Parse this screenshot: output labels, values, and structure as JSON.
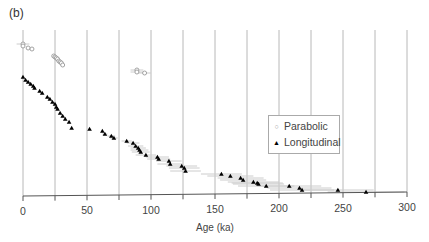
{
  "panel_label": "(b)",
  "chart_data": {
    "type": "scatter",
    "title": "",
    "panel": "(b)",
    "xlabel": "Age (ka)",
    "ylabel": "",
    "xlim": [
      0,
      300
    ],
    "xticks": [
      0,
      50,
      100,
      150,
      200,
      250,
      300
    ],
    "minor_gridlines_every": 25,
    "grid": "vertical",
    "legend_position": "right-middle",
    "series": [
      {
        "name": "Parabolic",
        "marker": "open-circle",
        "color": "#999999",
        "points": [
          {
            "x": 0,
            "y": 44,
            "err": 5
          },
          {
            "x": 0,
            "y": 46,
            "err": 0
          },
          {
            "x": 4,
            "y": 48,
            "err": 0
          },
          {
            "x": 7,
            "y": 49,
            "err": 0
          },
          {
            "x": 24,
            "y": 56,
            "err": 0
          },
          {
            "x": 25,
            "y": 57,
            "err": 0
          },
          {
            "x": 26,
            "y": 58,
            "err": 0
          },
          {
            "x": 27,
            "y": 59,
            "err": 0
          },
          {
            "x": 28,
            "y": 61,
            "err": 0
          },
          {
            "x": 29,
            "y": 62,
            "err": 0
          },
          {
            "x": 30,
            "y": 63,
            "err": 0
          },
          {
            "x": 31,
            "y": 65,
            "err": 0
          },
          {
            "x": 89,
            "y": 70,
            "err": 5
          },
          {
            "x": 89,
            "y": 72,
            "err": 5
          },
          {
            "x": 95,
            "y": 73,
            "err": 5
          }
        ]
      },
      {
        "name": "Longitudinal",
        "marker": "filled-triangle",
        "color": "#000000",
        "points": [
          {
            "x": 0,
            "y": 77,
            "err": 0
          },
          {
            "x": 2,
            "y": 80,
            "err": 0
          },
          {
            "x": 4,
            "y": 82,
            "err": 0
          },
          {
            "x": 6,
            "y": 84,
            "err": 0
          },
          {
            "x": 8,
            "y": 86,
            "err": 0
          },
          {
            "x": 9,
            "y": 88,
            "err": 0
          },
          {
            "x": 13,
            "y": 91,
            "err": 0
          },
          {
            "x": 15,
            "y": 93,
            "err": 0
          },
          {
            "x": 19,
            "y": 97,
            "err": 0
          },
          {
            "x": 21,
            "y": 99,
            "err": 0
          },
          {
            "x": 23,
            "y": 102,
            "err": 0
          },
          {
            "x": 25,
            "y": 104,
            "err": 0
          },
          {
            "x": 26,
            "y": 107,
            "err": 0
          },
          {
            "x": 27,
            "y": 109,
            "err": 0
          },
          {
            "x": 29,
            "y": 113,
            "err": 0
          },
          {
            "x": 31,
            "y": 116,
            "err": 0
          },
          {
            "x": 33,
            "y": 119,
            "err": 0
          },
          {
            "x": 36,
            "y": 122,
            "err": 0
          },
          {
            "x": 38,
            "y": 128,
            "err": 0
          },
          {
            "x": 52,
            "y": 129,
            "err": 0
          },
          {
            "x": 62,
            "y": 131,
            "err": 0
          },
          {
            "x": 64,
            "y": 134,
            "err": 2
          },
          {
            "x": 69,
            "y": 136,
            "err": 3
          },
          {
            "x": 71,
            "y": 138,
            "err": 3
          },
          {
            "x": 81,
            "y": 141,
            "err": 4
          },
          {
            "x": 86,
            "y": 143,
            "err": 5
          },
          {
            "x": 88,
            "y": 146,
            "err": 6
          },
          {
            "x": 90,
            "y": 148,
            "err": 6
          },
          {
            "x": 91,
            "y": 150,
            "err": 7
          },
          {
            "x": 92,
            "y": 152,
            "err": 7
          },
          {
            "x": 96,
            "y": 155,
            "err": 8
          },
          {
            "x": 105,
            "y": 157,
            "err": 9
          },
          {
            "x": 106,
            "y": 159,
            "err": 9
          },
          {
            "x": 114,
            "y": 161,
            "err": 10
          },
          {
            "x": 115,
            "y": 164,
            "err": 10
          },
          {
            "x": 124,
            "y": 166,
            "err": 12
          },
          {
            "x": 126,
            "y": 168,
            "err": 12
          },
          {
            "x": 127,
            "y": 171,
            "err": 12
          },
          {
            "x": 155,
            "y": 174,
            "err": 16
          },
          {
            "x": 162,
            "y": 176,
            "err": 18
          },
          {
            "x": 170,
            "y": 178,
            "err": 18
          },
          {
            "x": 172,
            "y": 180,
            "err": 18
          },
          {
            "x": 180,
            "y": 182,
            "err": 20
          },
          {
            "x": 183,
            "y": 183,
            "err": 20
          },
          {
            "x": 184,
            "y": 184,
            "err": 20
          },
          {
            "x": 190,
            "y": 186,
            "err": 22
          },
          {
            "x": 208,
            "y": 186,
            "err": 25
          },
          {
            "x": 216,
            "y": 188,
            "err": 25
          },
          {
            "x": 218,
            "y": 190,
            "err": 25
          },
          {
            "x": 246,
            "y": 190,
            "err": 28
          },
          {
            "x": 268,
            "y": 192,
            "err": 30
          }
        ]
      }
    ]
  },
  "legend": {
    "items": [
      {
        "label": "Parabolic",
        "symbol": "○"
      },
      {
        "label": "Longitudinal",
        "symbol": "▲"
      }
    ]
  },
  "colors": {
    "gridline": "#b8b8b8",
    "axis": "#555555",
    "parabolic": "#999999",
    "longitudinal": "#000000",
    "errorbar": "#cccccc"
  }
}
